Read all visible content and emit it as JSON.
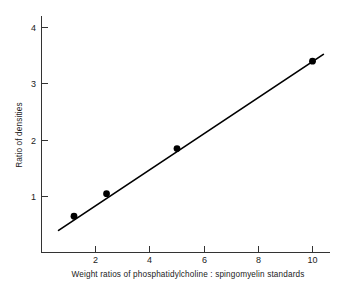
{
  "chart_data": {
    "type": "scatter",
    "title": "",
    "xlabel": "Weight ratios of phosphatidylcholine : spingomyelin standards",
    "ylabel": "Ratio of densities",
    "xlim": [
      0,
      11
    ],
    "ylim": [
      0,
      4.45
    ],
    "grid": false,
    "legend": null,
    "x_ticks": [
      2,
      4,
      6,
      8,
      10
    ],
    "x_tick_labels": [
      "2",
      "4",
      "6",
      "8",
      "10"
    ],
    "y_ticks": [
      1,
      2,
      3,
      4
    ],
    "y_tick_labels": [
      "1",
      "2",
      "3",
      "4"
    ],
    "x": [
      1.2,
      2.4,
      5.0,
      10.0
    ],
    "y": [
      0.65,
      1.05,
      1.85,
      3.4
    ],
    "points": [
      {
        "x": 1.2,
        "y": 0.65
      },
      {
        "x": 2.4,
        "y": 1.05
      },
      {
        "x": 5.0,
        "y": 1.85
      },
      {
        "x": 10.0,
        "y": 3.4
      }
    ],
    "fit_line": {
      "x_start": 0.63,
      "y_start": 0.4,
      "x_end": 10.4,
      "y_end": 3.52
    },
    "marker": "circle",
    "marker_color": "#000000",
    "line_color": "#000000"
  },
  "axes": {
    "x_tick_0": "2",
    "x_tick_1": "4",
    "x_tick_2": "6",
    "x_tick_3": "8",
    "x_tick_4": "10",
    "y_tick_0": "1",
    "y_tick_1": "2",
    "y_tick_2": "3",
    "y_tick_3": "4",
    "x_axis_title": "Weight ratios of phosphatidylcholine : spingomyelin standards",
    "y_axis_title": "Ratio of densities"
  }
}
